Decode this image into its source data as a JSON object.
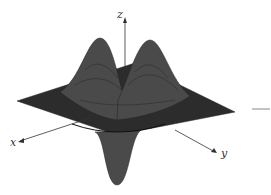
{
  "figure": {
    "type": "3d-surface-wireframe",
    "colors": {
      "surface": "#707070",
      "mesh": "#2a2a2a",
      "axis": "#333333",
      "background": "#ffffff"
    }
  },
  "axes": {
    "x_label": "x",
    "y_label": "y",
    "z_label": "z"
  },
  "features": {
    "peaks": 2,
    "troughs": 1
  }
}
